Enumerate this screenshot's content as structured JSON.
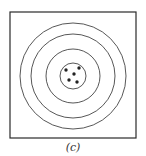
{
  "figure": {
    "label": "(c)",
    "frame": {
      "x": 10,
      "y": 12,
      "width": 126,
      "height": 126,
      "stroke": "#2a2a2a"
    },
    "target": {
      "center": [
        73,
        76
      ],
      "ring_radii": [
        53,
        42,
        27,
        13
      ],
      "stroke": "#444444"
    },
    "shots": [
      {
        "x": 66,
        "y": 70
      },
      {
        "x": 79,
        "y": 68
      },
      {
        "x": 74,
        "y": 74
      },
      {
        "x": 69,
        "y": 80
      },
      {
        "x": 77,
        "y": 82
      }
    ],
    "shot_color": "#222222"
  }
}
